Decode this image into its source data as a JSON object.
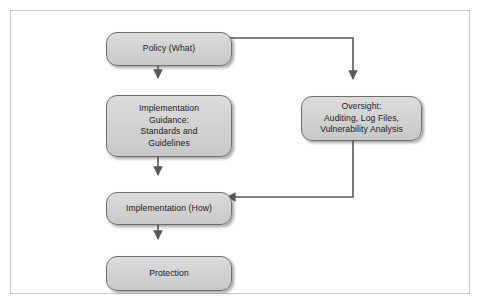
{
  "diagram": {
    "background_color": "#ffffff",
    "frame_border_color": "#c9c9c9",
    "node_fill_color": "#d3d3d3",
    "node_border_color": "#6e6e6e",
    "connector_color": "#595959",
    "text_color": "#1a1a1a",
    "nodes": [
      {
        "id": "policy",
        "name": "policy-node",
        "lines": [
          "Policy (What)"
        ]
      },
      {
        "id": "guidance",
        "name": "implementation-guidance-node",
        "lines": [
          "Implementation",
          "Guidance:",
          "Standards and",
          "Guidelines"
        ]
      },
      {
        "id": "oversight",
        "name": "oversight-node",
        "lines": [
          "Oversight:",
          "Auditing, Log Files,",
          "Vulnerability Analysis"
        ]
      },
      {
        "id": "implementation",
        "name": "implementation-node",
        "lines": [
          "Implementation (How)"
        ]
      },
      {
        "id": "protection",
        "name": "protection-node",
        "lines": [
          "Protection"
        ]
      }
    ],
    "connectors": [
      {
        "id": "policy-to-guidance",
        "from": "policy",
        "to": "guidance",
        "direction": "down"
      },
      {
        "id": "policy-to-oversight",
        "from": "policy",
        "to": "oversight",
        "direction": "right-then-down"
      },
      {
        "id": "guidance-to-implementation",
        "from": "guidance",
        "to": "implementation",
        "direction": "down"
      },
      {
        "id": "oversight-to-implementation",
        "from": "oversight",
        "to": "implementation",
        "direction": "down-then-left"
      },
      {
        "id": "implementation-to-protection",
        "from": "implementation",
        "to": "protection",
        "direction": "down"
      }
    ]
  }
}
